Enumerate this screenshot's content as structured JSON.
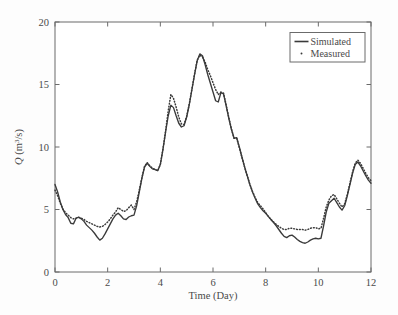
{
  "figure": {
    "background_color": "#fdfdfd",
    "axes_color": "#6b6b6b",
    "line_color": "#3a3a3a"
  },
  "chart_data": {
    "type": "line",
    "title": "",
    "xlabel": "Time (Day)",
    "ylabel": "Q (m3/s)",
    "ylabel_parts": {
      "symbol": "Q",
      "open": " (m",
      "exponent": "3",
      "close": "/s)"
    },
    "xlim": [
      0,
      12
    ],
    "ylim": [
      0,
      20
    ],
    "xticks": [
      0,
      2,
      4,
      6,
      8,
      10,
      12
    ],
    "yticks": [
      0,
      5,
      10,
      15,
      20
    ],
    "xtick_labels": [
      "0",
      "2",
      "4",
      "6",
      "8",
      "10",
      "12"
    ],
    "ytick_labels": [
      "0",
      "5",
      "10",
      "15",
      "20"
    ],
    "grid": false,
    "legend_position": "upper right",
    "legend_entries": [
      {
        "label": "Simulated",
        "style": "solid-line",
        "color": "#3a3a3a"
      },
      {
        "label": "Measured",
        "style": "dotted",
        "color": "#3a3a3a"
      }
    ],
    "series": [
      {
        "name": "Simulated",
        "style": "solid",
        "x": [
          0.0,
          0.1,
          0.2,
          0.3,
          0.4,
          0.5,
          0.6,
          0.7,
          0.8,
          0.9,
          1.0,
          1.1,
          1.2,
          1.3,
          1.4,
          1.5,
          1.6,
          1.7,
          1.8,
          1.9,
          2.0,
          2.1,
          2.2,
          2.3,
          2.4,
          2.5,
          2.6,
          2.7,
          2.8,
          2.9,
          3.0,
          3.1,
          3.2,
          3.3,
          3.4,
          3.5,
          3.6,
          3.7,
          3.8,
          3.9,
          4.0,
          4.1,
          4.2,
          4.3,
          4.4,
          4.5,
          4.6,
          4.7,
          4.8,
          4.9,
          5.0,
          5.1,
          5.2,
          5.3,
          5.4,
          5.5,
          5.6,
          5.7,
          5.8,
          5.9,
          6.0,
          6.1,
          6.2,
          6.3,
          6.4,
          6.5,
          6.6,
          6.7,
          6.8,
          6.9,
          7.0,
          7.1,
          7.2,
          7.3,
          7.4,
          7.5,
          7.6,
          7.7,
          7.8,
          7.9,
          8.0,
          8.1,
          8.2,
          8.3,
          8.4,
          8.5,
          8.6,
          8.7,
          8.8,
          8.9,
          9.0,
          9.1,
          9.2,
          9.3,
          9.4,
          9.5,
          9.6,
          9.7,
          9.8,
          9.9,
          10.0,
          10.1,
          10.2,
          10.3,
          10.4,
          10.5,
          10.6,
          10.7,
          10.8,
          10.9,
          11.0,
          11.1,
          11.2,
          11.3,
          11.4,
          11.5,
          11.6,
          11.7,
          11.8,
          11.9,
          12.0
        ],
        "y": [
          7.0,
          6.4,
          5.6,
          5.0,
          4.6,
          4.35,
          3.9,
          3.85,
          4.3,
          4.4,
          4.25,
          4.05,
          3.75,
          3.55,
          3.35,
          3.1,
          2.8,
          2.55,
          2.7,
          3.05,
          3.45,
          3.85,
          4.25,
          4.55,
          4.7,
          4.5,
          4.25,
          4.2,
          4.4,
          4.5,
          4.55,
          5.3,
          6.4,
          7.5,
          8.4,
          8.7,
          8.45,
          8.25,
          8.2,
          8.1,
          8.6,
          9.8,
          11.2,
          12.5,
          13.35,
          13.15,
          12.5,
          11.9,
          11.6,
          11.7,
          12.4,
          13.4,
          14.6,
          15.8,
          16.9,
          17.45,
          17.3,
          16.6,
          15.8,
          15.1,
          14.4,
          13.7,
          13.6,
          14.35,
          14.25,
          13.3,
          12.3,
          11.4,
          10.7,
          10.75,
          10.0,
          9.2,
          8.4,
          7.7,
          7.0,
          6.4,
          5.9,
          5.45,
          5.15,
          4.9,
          4.7,
          4.45,
          4.2,
          3.95,
          3.7,
          3.4,
          3.1,
          2.85,
          2.75,
          2.9,
          2.95,
          2.8,
          2.6,
          2.45,
          2.35,
          2.3,
          2.4,
          2.55,
          2.65,
          2.7,
          2.65,
          2.7,
          3.7,
          4.8,
          5.5,
          5.7,
          5.9,
          5.55,
          5.2,
          4.95,
          5.3,
          6.1,
          7.0,
          7.9,
          8.6,
          8.8,
          8.5,
          8.1,
          7.7,
          7.35,
          7.1
        ]
      },
      {
        "name": "Measured",
        "style": "dotted",
        "x": [
          0.0,
          0.1,
          0.2,
          0.3,
          0.4,
          0.5,
          0.6,
          0.7,
          0.8,
          0.9,
          1.0,
          1.1,
          1.2,
          1.3,
          1.4,
          1.5,
          1.6,
          1.7,
          1.8,
          1.9,
          2.0,
          2.1,
          2.2,
          2.3,
          2.4,
          2.5,
          2.6,
          2.7,
          2.8,
          2.9,
          3.0,
          3.1,
          3.2,
          3.3,
          3.4,
          3.5,
          3.6,
          3.7,
          3.8,
          3.9,
          4.0,
          4.1,
          4.2,
          4.3,
          4.4,
          4.5,
          4.6,
          4.7,
          4.8,
          4.9,
          5.0,
          5.1,
          5.2,
          5.3,
          5.4,
          5.5,
          5.6,
          5.7,
          5.8,
          5.9,
          6.0,
          6.1,
          6.2,
          6.3,
          6.4,
          6.5,
          6.6,
          6.7,
          6.8,
          6.9,
          7.0,
          7.1,
          7.2,
          7.3,
          7.4,
          7.5,
          7.6,
          7.7,
          7.8,
          7.9,
          8.0,
          8.1,
          8.2,
          8.3,
          8.4,
          8.5,
          8.6,
          8.7,
          8.8,
          8.9,
          9.0,
          9.1,
          9.2,
          9.3,
          9.4,
          9.5,
          9.6,
          9.7,
          9.8,
          9.9,
          10.0,
          10.1,
          10.2,
          10.3,
          10.4,
          10.5,
          10.6,
          10.7,
          10.8,
          10.9,
          11.0,
          11.1,
          11.2,
          11.3,
          11.4,
          11.5,
          11.6,
          11.7,
          11.8,
          11.9,
          12.0
        ],
        "y": [
          6.55,
          6.1,
          5.5,
          5.05,
          4.75,
          4.55,
          4.35,
          4.25,
          4.3,
          4.35,
          4.3,
          4.2,
          4.05,
          3.95,
          3.85,
          3.75,
          3.65,
          3.6,
          3.65,
          3.8,
          4.0,
          4.25,
          4.55,
          4.8,
          5.15,
          5.0,
          4.85,
          4.9,
          5.15,
          5.35,
          5.0,
          5.6,
          6.55,
          7.55,
          8.45,
          8.75,
          8.5,
          8.3,
          8.2,
          8.1,
          8.6,
          9.85,
          11.3,
          12.9,
          14.2,
          13.9,
          13.2,
          12.4,
          11.85,
          11.8,
          12.45,
          13.45,
          14.65,
          15.85,
          16.95,
          17.35,
          17.2,
          16.8,
          16.2,
          15.7,
          15.15,
          14.6,
          14.2,
          14.4,
          14.3,
          13.35,
          12.35,
          11.45,
          10.7,
          10.7,
          9.95,
          9.15,
          8.4,
          7.7,
          7.0,
          6.45,
          5.95,
          5.55,
          5.3,
          5.05,
          4.75,
          4.45,
          4.2,
          4.0,
          3.8,
          3.65,
          3.5,
          3.4,
          3.4,
          3.5,
          3.5,
          3.45,
          3.4,
          3.4,
          3.4,
          3.35,
          3.4,
          3.5,
          3.55,
          3.55,
          3.45,
          3.5,
          4.3,
          5.2,
          5.75,
          6.1,
          6.2,
          5.85,
          5.5,
          5.2,
          5.45,
          6.2,
          7.1,
          8.0,
          8.7,
          8.95,
          8.7,
          8.3,
          7.9,
          7.55,
          7.3
        ]
      }
    ]
  }
}
